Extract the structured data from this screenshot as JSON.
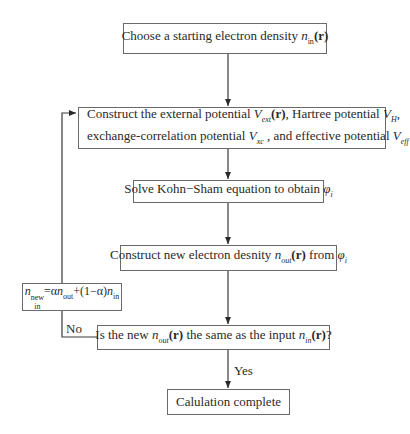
{
  "flowchart": {
    "nodes": {
      "start": {
        "prefix": "Choose a starting electron density ",
        "var": "n",
        "sub": "in",
        "arg": "(r)"
      },
      "construct_potentials": {
        "line1_a": "Construct the external potential ",
        "v_ext": "V",
        "v_ext_sub": "ext",
        "v_ext_arg": "(r)",
        "line1_b": ", Hartree potential ",
        "v_h": "V",
        "v_h_sub": "H",
        "line1_c": ",",
        "line2_a": "exchange-correlation potential ",
        "v_xc": "V",
        "v_xc_sub": "xc",
        "line2_b": " , and effective potential ",
        "v_eff": "V",
        "v_eff_sub": "eff"
      },
      "solve_ks": {
        "text": "Solve Kohn−Sham equation to obtain ",
        "phi": "φ",
        "phi_sub": "i"
      },
      "new_density": {
        "prefix": "Construct new electron desnity ",
        "var": "n",
        "sub": "out",
        "arg": "(r)",
        "mid": " from ",
        "phi": "φ",
        "phi_sub": "i"
      },
      "mixing": {
        "n": "n",
        "n_sub": "in",
        "n_sup": "new",
        "eq": "=",
        "alpha": "α",
        "n_out": "n",
        "n_out_sub": "out",
        "plus": "+(1−",
        "alpha2": "α",
        "close": ")",
        "n_in": "n",
        "n_in_sub": "in"
      },
      "decision": {
        "a": "Is the new ",
        "n_out": "n",
        "n_out_sub": "out",
        "arg1": "(r)",
        "b": " the same as the input ",
        "n_in": "n",
        "n_in_sub": "in",
        "arg2": "(r)",
        "c": "?"
      },
      "end": {
        "text": "Calulation complete"
      }
    },
    "edge_labels": {
      "no": "No",
      "yes": "Yes"
    },
    "colors": {
      "line": "#3a3a3a",
      "box_border": "#6a6a6a",
      "text": "#2a2a2a"
    }
  }
}
